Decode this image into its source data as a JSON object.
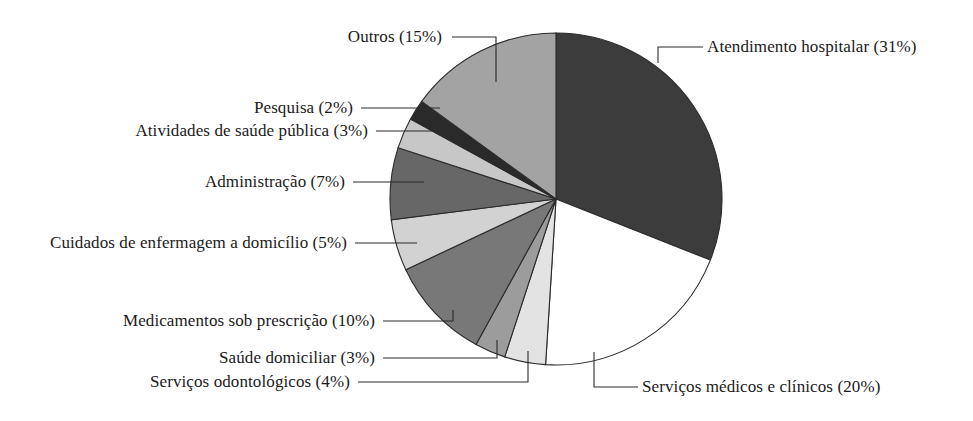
{
  "chart_data": {
    "type": "pie",
    "title": "",
    "subtitle": "",
    "xlabel": "",
    "ylabel": "",
    "legend_position": "callout-labels",
    "grid": false,
    "units": "percent",
    "total": 100,
    "start_angle_deg": 0,
    "direction": "clockwise",
    "categories": [
      "Atendimento hospitalar",
      "Serviços médicos e clínicos",
      "Serviços odontológicos",
      "Saúde domiciliar",
      "Medicamentos sob prescrição",
      "Cuidados de enfermagem a domicílio",
      "Administração",
      "Atividades de saúde pública",
      "Pesquisa",
      "Outros"
    ],
    "values": [
      31,
      20,
      4,
      3,
      10,
      5,
      7,
      3,
      2,
      15
    ],
    "labels": [
      "Atendimento hospitalar (31%)",
      "Serviços médicos e clínicos (20%)",
      "Serviços odontológicos (4%)",
      "Saúde domiciliar (3%)",
      "Medicamentos sob prescrição (10%)",
      "Cuidados de enfermagem a domicílio (5%)",
      "Administração (7%)",
      "Atividades de saúde pública (3%)",
      "Pesquisa (2%)",
      "Outros (15%)"
    ],
    "colors": [
      "#3c3c3c",
      "#ffffff",
      "#e3e3e3",
      "#9c9c9c",
      "#787878",
      "#d2d2d2",
      "#676767",
      "#c7c7c7",
      "#2a2a2a",
      "#a3a3a3"
    ],
    "slices": [
      {
        "name": "Atendimento hospitalar",
        "value": 31,
        "label": "Atendimento hospitalar (31%)",
        "color": "#3c3c3c"
      },
      {
        "name": "Serviços médicos e clínicos",
        "value": 20,
        "label": "Serviços médicos e clínicos (20%)",
        "color": "#ffffff"
      },
      {
        "name": "Serviços odontológicos",
        "value": 4,
        "label": "Serviços odontológicos (4%)",
        "color": "#e3e3e3"
      },
      {
        "name": "Saúde domiciliar",
        "value": 3,
        "label": "Saúde domiciliar (3%)",
        "color": "#9c9c9c"
      },
      {
        "name": "Medicamentos sob prescrição",
        "value": 10,
        "label": "Medicamentos sob prescrição (10%)",
        "color": "#787878"
      },
      {
        "name": "Cuidados de enfermagem a domicílio",
        "value": 5,
        "label": "Cuidados de enfermagem a domicílio (5%)",
        "color": "#d2d2d2"
      },
      {
        "name": "Administração",
        "value": 7,
        "label": "Administração (7%)",
        "color": "#676767"
      },
      {
        "name": "Atividades de saúde pública",
        "value": 3,
        "label": "Atividades de saúde pública (3%)",
        "color": "#c7c7c7"
      },
      {
        "name": "Pesquisa",
        "value": 2,
        "label": "Pesquisa (2%)",
        "color": "#2a2a2a"
      },
      {
        "name": "Outros",
        "value": 15,
        "label": "Outros (15%)",
        "color": "#a3a3a3"
      }
    ]
  },
  "labels": {
    "atendimento_hospitalar": "Atendimento hospitalar (31%)",
    "servicos_medicos": "Serviços médicos e clínicos (20%)",
    "servicos_odontologicos": "Serviços odontológicos (4%)",
    "saude_domiciliar": "Saúde domiciliar (3%)",
    "medicamentos": "Medicamentos sob prescrição (10%)",
    "cuidados_enfermagem": "Cuidados de enfermagem a domicílio (5%)",
    "administracao": "Administração (7%)",
    "atividades_saude_publica": "Atividades de saúde pública (3%)",
    "pesquisa": "Pesquisa (2%)",
    "outros": "Outros (15%)"
  },
  "style": {
    "background": "#ffffff",
    "outline": "#2b2b2b",
    "text": "#1a1a1a"
  }
}
